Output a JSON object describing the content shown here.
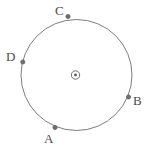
{
  "figure": {
    "type": "geometry-diagram",
    "canvas": {
      "width": 147,
      "height": 150
    },
    "background_color": "#ffffff",
    "stroke_color": "#7d7d7d",
    "label_color": "#4a4a4a",
    "marker_color": "#6e6e6e",
    "circle": {
      "center_x": 76.5,
      "center_y": 75,
      "radius": 55.5,
      "stroke_width": 1
    },
    "center_marker": {
      "name": "circle-center-mark",
      "symbol": "circled-dot",
      "x": 75.5,
      "y": 75,
      "outer_radius": 4.2,
      "inner_radius": 1.4
    },
    "points": [
      {
        "id": "A",
        "label": "A",
        "marker_x": 55,
        "marker_y": 127.5,
        "label_x": 44,
        "label_y": 132,
        "marker_radius": 2.1
      },
      {
        "id": "B",
        "label": "B",
        "marker_x": 128.5,
        "marker_y": 97,
        "label_x": 133,
        "label_y": 94,
        "marker_radius": 2.1
      },
      {
        "id": "C",
        "label": "C",
        "marker_x": 68,
        "marker_y": 16.5,
        "label_x": 55,
        "label_y": 4,
        "marker_radius": 2.1
      },
      {
        "id": "D",
        "label": "D",
        "marker_x": 22.8,
        "marker_y": 62,
        "label_x": 6,
        "label_y": 50,
        "marker_radius": 2.1
      }
    ]
  }
}
